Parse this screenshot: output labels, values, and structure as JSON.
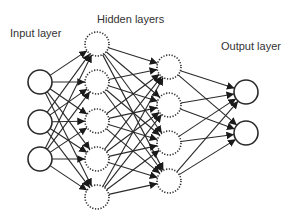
{
  "diagram": {
    "type": "neural-network",
    "labels": {
      "input": "Input layer",
      "hidden": "Hidden layers",
      "output": "Output layer"
    },
    "layers": [
      {
        "name": "input",
        "node_count": 3,
        "style": "solid",
        "cx": 40,
        "cy": [
          82,
          122,
          159
        ]
      },
      {
        "name": "hidden-1",
        "node_count": 5,
        "style": "dotted",
        "cx": 97,
        "cy": [
          44,
          82,
          121,
          159,
          197
        ]
      },
      {
        "name": "hidden-2",
        "node_count": 4,
        "style": "dotted",
        "cx": 169,
        "cy": [
          67,
          105,
          143,
          181
        ]
      },
      {
        "name": "output",
        "node_count": 2,
        "style": "solid",
        "cx": 246,
        "cy": [
          92,
          133
        ]
      }
    ],
    "node_radius": 12,
    "connections": "fully-connected",
    "colors": {
      "stroke": "#2a2a2a",
      "text": "#333333",
      "background": "#ffffff"
    }
  }
}
